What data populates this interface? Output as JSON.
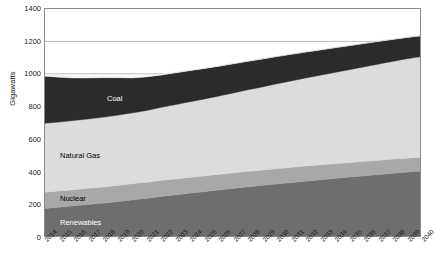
{
  "chart_data": {
    "type": "area",
    "stacked": true,
    "title": "",
    "xlabel": "",
    "ylabel": "Gigawatts",
    "ylim": [
      0,
      1400
    ],
    "ytick_step": 200,
    "yticks": [
      0,
      200,
      400,
      600,
      800,
      1000,
      1200,
      1400
    ],
    "grid": "horizontal-major-light",
    "legend_position": "inline-labels",
    "categories": [
      "2014",
      "2015",
      "2016",
      "2017",
      "2018",
      "2019",
      "2020",
      "2021",
      "2022",
      "2023",
      "2024",
      "2025",
      "2026",
      "2027",
      "2028",
      "2029",
      "2030",
      "2031",
      "2032",
      "2033",
      "2034",
      "2035",
      "2036",
      "2037",
      "2038",
      "2039",
      "2040"
    ],
    "series": [
      {
        "name": "Renewables",
        "color": "#6e6e6e",
        "label_color": "#ffffff",
        "values": [
          170,
          178,
          186,
          194,
          202,
          212,
          222,
          232,
          243,
          253,
          263,
          273,
          283,
          293,
          302,
          311,
          320,
          329,
          338,
          346,
          354,
          362,
          370,
          378,
          386,
          393,
          400
        ]
      },
      {
        "name": "Nuclear",
        "color": "#a8a8a8",
        "label_color": "#000000",
        "values": [
          100,
          100,
          100,
          100,
          100,
          100,
          100,
          99,
          99,
          98,
          98,
          97,
          97,
          96,
          96,
          95,
          95,
          94,
          93,
          92,
          91,
          90,
          89,
          88,
          87,
          86,
          85
        ]
      },
      {
        "name": "Natural Gas",
        "color": "#dcdcdc",
        "label_color": "#000000",
        "values": [
          425,
          425,
          426,
          428,
          430,
          432,
          436,
          442,
          450,
          458,
          466,
          474,
          482,
          492,
          502,
          512,
          522,
          532,
          542,
          552,
          562,
          572,
          582,
          592,
          602,
          612,
          620
        ]
      },
      {
        "name": "Coal",
        "color": "#2b2b2b",
        "label_color": "#ffffff",
        "values": [
          290,
          276,
          262,
          252,
          244,
          232,
          216,
          208,
          200,
          196,
          192,
          188,
          184,
          180,
          176,
          172,
          168,
          164,
          160,
          156,
          152,
          148,
          144,
          140,
          136,
          132,
          128
        ]
      },
      {
        "name": "Other",
        "color": "#f2f2f2",
        "label_color": "#000000",
        "show_label": false,
        "values": [
          14,
          13,
          12,
          11,
          10,
          9,
          8,
          7,
          6,
          5,
          4,
          4,
          3,
          3,
          3,
          3,
          2,
          2,
          2,
          2,
          2,
          2,
          2,
          2,
          2,
          2,
          2
        ]
      }
    ],
    "totals": [
      999,
      992,
      986,
      985,
      986,
      985,
      982,
      988,
      998,
      1010,
      1023,
      1036,
      1049,
      1064,
      1079,
      1093,
      1107,
      1121,
      1135,
      1148,
      1161,
      1174,
      1187,
      1200,
      1213,
      1225,
      1235
    ],
    "inline_labels": [
      {
        "text": "Coal",
        "series": "Coal"
      },
      {
        "text": "Natural Gas",
        "series": "Natural Gas"
      },
      {
        "text": "Nuclear",
        "series": "Nuclear"
      },
      {
        "text": "Renewables",
        "series": "Renewables"
      }
    ]
  },
  "style": {
    "plot_border": "#8a8a8a",
    "gridline": "#bdbdbd",
    "text": "#1a1a1a",
    "background": "#ffffff"
  }
}
